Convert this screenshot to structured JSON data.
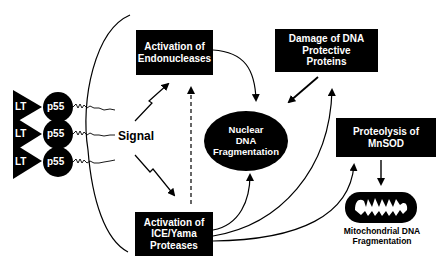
{
  "diagram": {
    "receptors": [
      {
        "ligand": "LT",
        "receptor": "p55"
      },
      {
        "ligand": "LT",
        "receptor": "p55"
      },
      {
        "ligand": "LT",
        "receptor": "p55"
      }
    ],
    "signal_label": "Signal",
    "nodes": {
      "endonucleases": {
        "line1": "Activation of",
        "line2": "Endonucleases"
      },
      "dna_protective": {
        "line1": "Damage of DNA",
        "line2": "Protective",
        "line3": "Proteins"
      },
      "nuclear_dna": {
        "line1": "Nuclear",
        "line2": "DNA",
        "line3": "Fragmentation"
      },
      "mnsod": {
        "line1": "Proteolysis of",
        "line2": "MnSOD"
      },
      "ice_yama": {
        "line1": "Activation of",
        "line2": "ICE/Yama",
        "line3": "Proteases"
      },
      "mito": {
        "line1": "Mitochondrial DNA",
        "line2": "Fragmentation"
      }
    },
    "edges": [
      {
        "from": "signal",
        "to": "endonucleases",
        "style": "lightning"
      },
      {
        "from": "signal",
        "to": "ice_yama",
        "style": "lightning"
      },
      {
        "from": "ice_yama",
        "to": "endonucleases",
        "style": "dashed"
      },
      {
        "from": "endonucleases",
        "to": "nuclear_dna",
        "style": "curved"
      },
      {
        "from": "dna_protective",
        "to": "nuclear_dna",
        "style": "straight"
      },
      {
        "from": "ice_yama",
        "to": "nuclear_dna",
        "style": "curved"
      },
      {
        "from": "ice_yama",
        "to": "dna_protective",
        "style": "curved"
      },
      {
        "from": "ice_yama",
        "to": "mnsod",
        "style": "curved"
      },
      {
        "from": "mnsod",
        "to": "mito",
        "style": "straight"
      }
    ],
    "colors": {
      "fill": "#000000",
      "text_on_fill": "#ffffff",
      "background": "#ffffff"
    }
  }
}
